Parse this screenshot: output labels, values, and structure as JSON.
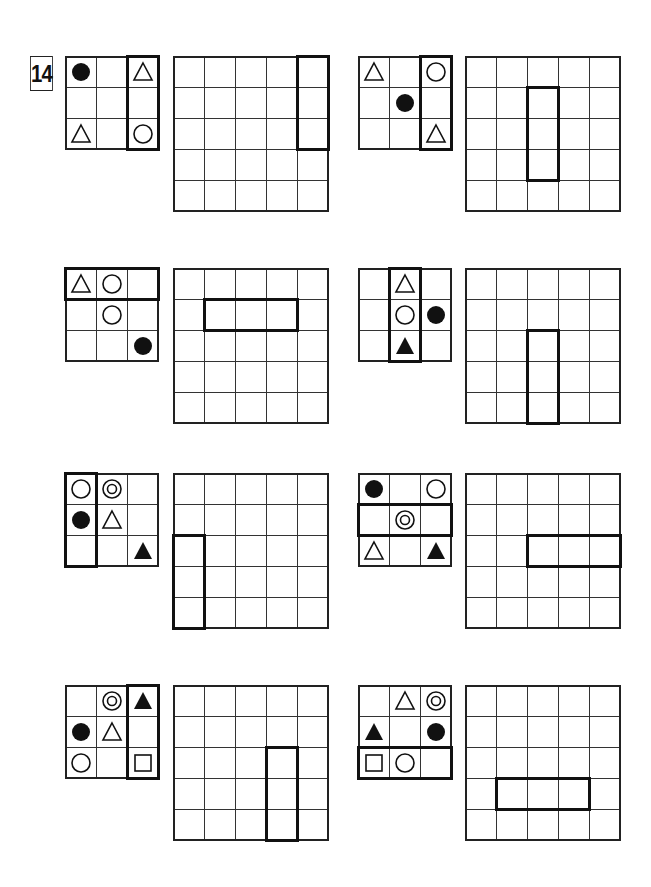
{
  "puzzle": {
    "number": "14",
    "cell_size": 31,
    "colors": {
      "line": "#333333",
      "highlight": "#111111",
      "background": "#ffffff"
    },
    "symbols_legend": {
      "filled-circle": "●",
      "open-circle": "○",
      "open-triangle": "△",
      "filled-triangle": "▲",
      "double-circle": "◎",
      "open-square": "□"
    },
    "problems": [
      {
        "id": "p1",
        "small": {
          "x": 65,
          "y": 56,
          "cells": [
            [
              "filled-circle",
              "",
              "open-triangle"
            ],
            [
              "",
              "",
              ""
            ],
            [
              "open-triangle",
              "",
              "open-circle"
            ]
          ],
          "highlight": {
            "row": 0,
            "col": 2,
            "rows": 3,
            "cols": 1
          }
        },
        "big": {
          "x": 173,
          "y": 56,
          "highlight": {
            "row": 0,
            "col": 4,
            "rows": 3,
            "cols": 1
          }
        }
      },
      {
        "id": "p2",
        "small": {
          "x": 358,
          "y": 56,
          "cells": [
            [
              "open-triangle",
              "",
              "open-circle"
            ],
            [
              "",
              "filled-circle",
              ""
            ],
            [
              "",
              "",
              "open-triangle"
            ]
          ],
          "highlight": {
            "row": 0,
            "col": 2,
            "rows": 3,
            "cols": 1
          }
        },
        "big": {
          "x": 465,
          "y": 56,
          "highlight": {
            "row": 1,
            "col": 2,
            "rows": 3,
            "cols": 1
          }
        }
      },
      {
        "id": "p3",
        "small": {
          "x": 65,
          "y": 268,
          "cells": [
            [
              "open-triangle",
              "open-circle",
              ""
            ],
            [
              "",
              "open-circle",
              ""
            ],
            [
              "",
              "",
              "filled-circle"
            ]
          ],
          "highlight": {
            "row": 0,
            "col": 0,
            "rows": 1,
            "cols": 3
          }
        },
        "big": {
          "x": 173,
          "y": 268,
          "highlight": {
            "row": 1,
            "col": 1,
            "rows": 1,
            "cols": 3
          }
        }
      },
      {
        "id": "p4",
        "small": {
          "x": 358,
          "y": 268,
          "cells": [
            [
              "",
              "open-triangle",
              ""
            ],
            [
              "",
              "open-circle",
              "filled-circle"
            ],
            [
              "",
              "filled-triangle",
              ""
            ]
          ],
          "highlight": {
            "row": 0,
            "col": 1,
            "rows": 3,
            "cols": 1
          }
        },
        "big": {
          "x": 465,
          "y": 268,
          "highlight": {
            "row": 2,
            "col": 2,
            "rows": 3,
            "cols": 1
          }
        }
      },
      {
        "id": "p5",
        "small": {
          "x": 65,
          "y": 473,
          "cells": [
            [
              "open-circle",
              "double-circle",
              ""
            ],
            [
              "filled-circle",
              "open-triangle",
              ""
            ],
            [
              "",
              "",
              "filled-triangle"
            ]
          ],
          "highlight": {
            "row": 0,
            "col": 0,
            "rows": 3,
            "cols": 1
          }
        },
        "big": {
          "x": 173,
          "y": 473,
          "highlight": {
            "row": 2,
            "col": 0,
            "rows": 3,
            "cols": 1
          }
        }
      },
      {
        "id": "p6",
        "small": {
          "x": 358,
          "y": 473,
          "cells": [
            [
              "filled-circle",
              "",
              "open-circle"
            ],
            [
              "",
              "double-circle",
              ""
            ],
            [
              "open-triangle",
              "",
              "filled-triangle"
            ]
          ],
          "highlight": {
            "row": 1,
            "col": 0,
            "rows": 1,
            "cols": 3
          }
        },
        "big": {
          "x": 465,
          "y": 473,
          "highlight": {
            "row": 2,
            "col": 2,
            "rows": 1,
            "cols": 3
          }
        }
      },
      {
        "id": "p7",
        "small": {
          "x": 65,
          "y": 685,
          "cells": [
            [
              "",
              "double-circle",
              "filled-triangle"
            ],
            [
              "filled-circle",
              "open-triangle",
              ""
            ],
            [
              "open-circle",
              "",
              "open-square"
            ]
          ],
          "highlight": {
            "row": 0,
            "col": 2,
            "rows": 3,
            "cols": 1
          }
        },
        "big": {
          "x": 173,
          "y": 685,
          "highlight": {
            "row": 2,
            "col": 3,
            "rows": 3,
            "cols": 1
          }
        }
      },
      {
        "id": "p8",
        "small": {
          "x": 358,
          "y": 685,
          "cells": [
            [
              "",
              "open-triangle",
              "double-circle"
            ],
            [
              "filled-triangle",
              "",
              "filled-circle"
            ],
            [
              "open-square",
              "open-circle",
              ""
            ]
          ],
          "highlight": {
            "row": 2,
            "col": 0,
            "rows": 1,
            "cols": 3
          }
        },
        "big": {
          "x": 465,
          "y": 685,
          "highlight": {
            "row": 3,
            "col": 1,
            "rows": 1,
            "cols": 3
          }
        }
      }
    ]
  }
}
